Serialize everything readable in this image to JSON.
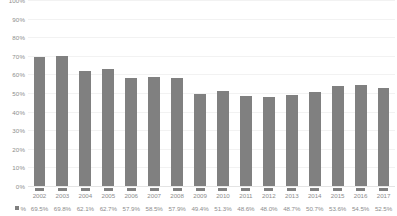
{
  "chart_data": {
    "type": "bar",
    "title": "",
    "subtitle": "",
    "xlabel": "",
    "ylabel": "",
    "ylim": [
      0,
      100
    ],
    "grid": true,
    "legend_position": "bottom-left-table",
    "series_name": "%",
    "bar_color": "#808080",
    "gridline_color": "#f2f2f2",
    "axis_text_color": "#8d8d8d",
    "categories": [
      "2002",
      "2003",
      "2004",
      "2005",
      "2006",
      "2007",
      "2008",
      "2009",
      "2010",
      "2011",
      "2012",
      "2013",
      "2014",
      "2015",
      "2016",
      "2017"
    ],
    "values": [
      69.5,
      69.8,
      62.1,
      62.7,
      57.9,
      58.5,
      57.9,
      49.4,
      51.3,
      48.6,
      48.0,
      48.7,
      50.7,
      53.6,
      54.5,
      52.5
    ],
    "value_labels": [
      "69.5%",
      "69.8%",
      "62.1%",
      "62.7%",
      "57.9%",
      "58.5%",
      "57.9%",
      "49.4%",
      "51.3%",
      "48.6%",
      "48.0%",
      "48.7%",
      "50.7%",
      "53.6%",
      "54.5%",
      "52.5%"
    ],
    "y_ticks": [
      100,
      90,
      80,
      70,
      60,
      50,
      40,
      30,
      20,
      10,
      0
    ],
    "y_tick_labels": [
      "100%",
      "90%",
      "80%",
      "70%",
      "60%",
      "50%",
      "40%",
      "30%",
      "20%",
      "10%",
      "0%"
    ]
  }
}
